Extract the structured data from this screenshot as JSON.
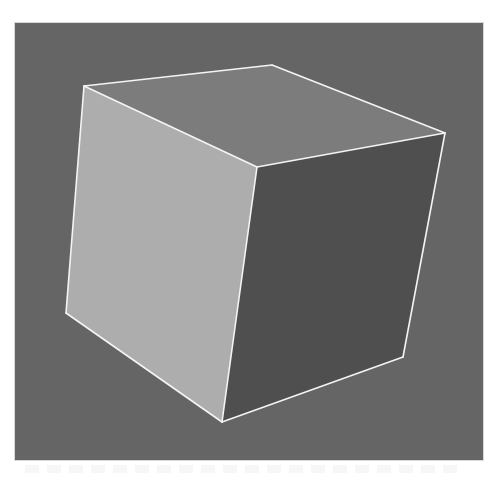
{
  "figure": {
    "background_color": "#656565",
    "edge_color": "#f4f4f4",
    "faces": [
      {
        "name": "top",
        "color": "#7c7c7c",
        "points": "84,86 272,65 445,133 257,167"
      },
      {
        "name": "left",
        "color": "#adadad",
        "points": "84,86 257,167 222,422 66,313"
      },
      {
        "name": "right",
        "color": "#4f4f4f",
        "points": "257,167 445,133 403,357 222,422"
      }
    ],
    "edges": [
      "84,86 272,65",
      "272,65 445,133",
      "445,133 257,167",
      "257,167 84,86",
      "84,86 66,313",
      "66,313 222,422",
      "222,422 257,167",
      "222,422 403,357",
      "403,357 445,133"
    ]
  }
}
